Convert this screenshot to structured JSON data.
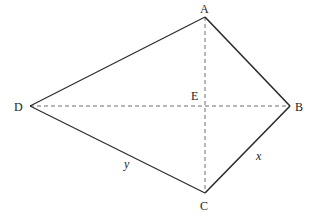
{
  "diagram": {
    "type": "kite",
    "vertices": {
      "A": {
        "label": "A",
        "x": 205,
        "y": 17
      },
      "B": {
        "label": "B",
        "x": 290,
        "y": 106
      },
      "C": {
        "label": "C",
        "x": 205,
        "y": 193
      },
      "D": {
        "label": "D",
        "x": 30,
        "y": 106
      },
      "E": {
        "label": "E",
        "x": 205,
        "y": 106
      }
    },
    "sides": [
      {
        "from": "A",
        "to": "B"
      },
      {
        "from": "B",
        "to": "C",
        "label": "x"
      },
      {
        "from": "C",
        "to": "D",
        "label": "y"
      },
      {
        "from": "D",
        "to": "A"
      }
    ],
    "diagonals": [
      {
        "from": "A",
        "to": "C",
        "style": "dashed"
      },
      {
        "from": "D",
        "to": "B",
        "style": "dashed"
      }
    ],
    "side_labels": {
      "x": "x",
      "y": "y"
    },
    "colors": {
      "line": "#2b2b2b",
      "dashed": "#6e6e6e",
      "text": "#222222"
    }
  }
}
